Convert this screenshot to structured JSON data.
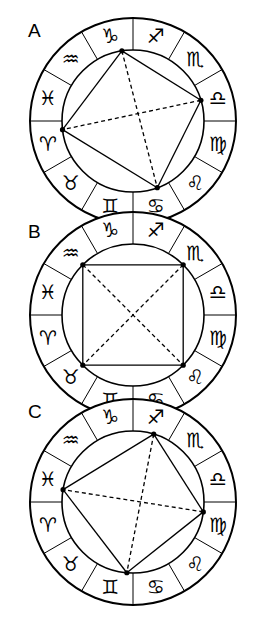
{
  "figure": {
    "title": "",
    "width": 262,
    "height": 621,
    "background_color": "#ffffff",
    "line_color": "#000000"
  },
  "zodiac_glyphs": {
    "aries": "♈",
    "taurus": "♉",
    "gemini": "♊",
    "cancer": "♋",
    "leo": "♌",
    "virgo": "♍",
    "libra": "♎",
    "scorpio": "♏",
    "sagittarius": "♐",
    "capricorn": "♑",
    "aquarius": "♒",
    "pisces": "♓"
  },
  "zodiac_order_counterclockwise_from_top_right": [
    {
      "name": "sagittarius",
      "glyph": "♐",
      "sector_center_deg": 75
    },
    {
      "name": "scorpio",
      "glyph": "♏",
      "sector_center_deg": 45
    },
    {
      "name": "libra",
      "glyph": "♎",
      "sector_center_deg": 15
    },
    {
      "name": "virgo",
      "glyph": "♍",
      "sector_center_deg": -15
    },
    {
      "name": "leo",
      "glyph": "♌",
      "sector_center_deg": -45
    },
    {
      "name": "cancer",
      "glyph": "♋",
      "sector_center_deg": -75
    },
    {
      "name": "gemini",
      "glyph": "♊",
      "sector_center_deg": -105
    },
    {
      "name": "taurus",
      "glyph": "♉",
      "sector_center_deg": -135
    },
    {
      "name": "aries",
      "glyph": "♈",
      "sector_center_deg": -165
    },
    {
      "name": "pisces",
      "glyph": "♓",
      "sector_center_deg": 165
    },
    {
      "name": "aquarius",
      "glyph": "♒",
      "sector_center_deg": 135
    },
    {
      "name": "capricorn",
      "glyph": "♑",
      "sector_center_deg": 105
    }
  ],
  "wheels": [
    {
      "id": "A",
      "label": "A",
      "label_x": 28,
      "label_y": 37,
      "center_x": 133,
      "center_y": 121,
      "outer_radius": 103,
      "inner_radius": 71,
      "points": [
        {
          "name": "point-capricorn",
          "sign": "capricorn",
          "angle_deg": 99,
          "radius": 71
        },
        {
          "name": "point-libra",
          "sign": "libra",
          "angle_deg": 17,
          "radius": 71
        },
        {
          "name": "point-gemini",
          "sign": "gemini",
          "angle_deg": -70,
          "radius": 71
        },
        {
          "name": "point-aries",
          "sign": "aries",
          "angle_deg": 187,
          "radius": 71
        }
      ],
      "solid_edges": [
        [
          0,
          1
        ],
        [
          1,
          2
        ],
        [
          2,
          3
        ],
        [
          3,
          0
        ]
      ],
      "dashed_edges": [
        [
          0,
          2
        ],
        [
          1,
          3
        ]
      ],
      "shape": "quadrilateral"
    },
    {
      "id": "B",
      "label": "B",
      "label_x": 28,
      "label_y": 238,
      "center_x": 133,
      "center_y": 315,
      "outer_radius": 103,
      "inner_radius": 71,
      "points": [
        {
          "name": "point-aquarius",
          "sign": "aquarius",
          "angle_deg": 135,
          "radius": 71
        },
        {
          "name": "point-scorpio",
          "sign": "scorpio",
          "angle_deg": 45,
          "radius": 71
        },
        {
          "name": "point-leo",
          "sign": "leo",
          "angle_deg": -45,
          "radius": 71
        },
        {
          "name": "point-taurus",
          "sign": "taurus",
          "angle_deg": -135,
          "radius": 71
        }
      ],
      "solid_edges": [
        [
          0,
          1
        ],
        [
          1,
          2
        ],
        [
          2,
          3
        ],
        [
          3,
          0
        ]
      ],
      "dashed_edges": [
        [
          0,
          2
        ],
        [
          1,
          3
        ]
      ],
      "shape": "square"
    },
    {
      "id": "C",
      "label": "C",
      "label_x": 28,
      "label_y": 418,
      "center_x": 133,
      "center_y": 502,
      "outer_radius": 103,
      "inner_radius": 71,
      "points": [
        {
          "name": "point-sagittarius",
          "sign": "sagittarius",
          "angle_deg": 73,
          "radius": 71
        },
        {
          "name": "point-virgo",
          "sign": "virgo",
          "angle_deg": -8,
          "radius": 71
        },
        {
          "name": "point-gemini",
          "sign": "gemini",
          "angle_deg": -95,
          "radius": 71
        },
        {
          "name": "point-pisces",
          "sign": "pisces",
          "angle_deg": 170,
          "radius": 71
        }
      ],
      "solid_edges": [
        [
          0,
          1
        ],
        [
          1,
          2
        ],
        [
          2,
          3
        ],
        [
          3,
          0
        ]
      ],
      "dashed_edges": [
        [
          0,
          2
        ],
        [
          1,
          3
        ]
      ],
      "shape": "quadrilateral"
    }
  ],
  "style": {
    "outer_stroke_width": 2.0,
    "inner_stroke_width": 1.6,
    "spoke_stroke_width": 1.0,
    "aspect_stroke_width": 1.3,
    "dash_pattern": "4,3",
    "dot_radius": 2.6
  }
}
